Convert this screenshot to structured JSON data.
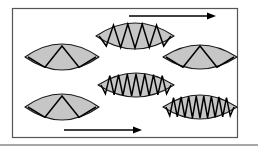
{
  "figure": {
    "canvas": {
      "width": 258,
      "height": 150
    },
    "background_color": "#ffffff",
    "frame": {
      "name": "figure-border",
      "x": 12,
      "y": 8,
      "width": 225,
      "height": 129,
      "stroke_color": "#555555",
      "stroke_width": 1.2,
      "fill_color": "#ffffff"
    },
    "page_edge": {
      "name": "page-bottom-edge",
      "y": 145,
      "x1": 0,
      "x2": 258,
      "stroke_color": "#8a8a8a",
      "stroke_width": 1.5
    },
    "style": {
      "lens_fill_color": "#c6c6c6",
      "lens_stroke_color": "#1a1a1a",
      "lens_stroke_width": 1.2,
      "wave_stroke_color": "#000000",
      "wave_stroke_width": 1.5,
      "arrow_color": "#000000"
    },
    "lenses": [
      {
        "id": "lens-left-upper",
        "label": "Lens 1 — lowest frequency",
        "cx": 62,
        "cy": 57,
        "rx": 37,
        "ry": 13,
        "peaks": 2,
        "amplitude": 11
      },
      {
        "id": "lens-center-top",
        "label": "Lens 2 — medium-low frequency",
        "cx": 135,
        "cy": 36,
        "rx": 39,
        "ry": 13,
        "peaks": 5,
        "amplitude": 12
      },
      {
        "id": "lens-right-upper",
        "label": "Lens 3 — low frequency",
        "cx": 200,
        "cy": 57,
        "rx": 37,
        "ry": 12,
        "peaks": 2,
        "amplitude": 11
      },
      {
        "id": "lens-center-middle",
        "label": "Lens 4 — high frequency",
        "cx": 136,
        "cy": 85,
        "rx": 38,
        "ry": 12,
        "peaks": 8,
        "amplitude": 11
      },
      {
        "id": "lens-left-lower",
        "label": "Lens 5 — low frequency",
        "cx": 62,
        "cy": 107,
        "rx": 37,
        "ry": 13,
        "peaks": 2,
        "amplitude": 11
      },
      {
        "id": "lens-right-lower",
        "label": "Lens 6 — highest frequency",
        "cx": 200,
        "cy": 107,
        "rx": 37,
        "ry": 12,
        "peaks": 9,
        "amplitude": 11
      }
    ],
    "arrows": [
      {
        "id": "arrow-top",
        "label": "Top direction arrow pointing right",
        "x1": 129,
        "x2": 216,
        "y": 16,
        "head_length": 9,
        "head_width": 7,
        "line_width": 1.6
      },
      {
        "id": "arrow-bottom",
        "label": "Bottom direction arrow pointing right",
        "x1": 64,
        "x2": 142,
        "y": 130,
        "head_length": 9,
        "head_width": 7,
        "line_width": 1.6
      }
    ]
  }
}
